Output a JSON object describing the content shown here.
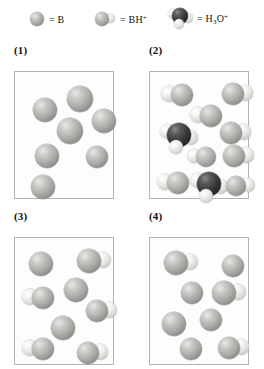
{
  "legend": {
    "entries": [
      {
        "name": "boron-base",
        "icon": "single-grey-sphere",
        "equals": "=",
        "label": "B"
      },
      {
        "name": "bh-cation",
        "icon": "grey-sphere-with-hydrogen",
        "equals": "=",
        "label_main": "BH",
        "label_sup": "+"
      },
      {
        "name": "hydronium",
        "icon": "dark-sphere-with-three-hydrogens",
        "equals": "=",
        "label_main": "H",
        "label_sub": "3",
        "label_main2": "O",
        "label_sup": "+"
      }
    ]
  },
  "panels": [
    {
      "id": "panel-1",
      "title": "(1)",
      "species_counts": {
        "B": 7,
        "BH+": 0,
        "H3O+": 0
      },
      "molecules": [
        {
          "type": "B",
          "x": 52,
          "y": 14,
          "r": 13
        },
        {
          "type": "B",
          "x": 18,
          "y": 26,
          "r": 12
        },
        {
          "type": "B",
          "x": 77,
          "y": 37,
          "r": 12
        },
        {
          "type": "B",
          "x": 42,
          "y": 46,
          "r": 13
        },
        {
          "type": "B",
          "x": 20,
          "y": 72,
          "r": 12
        },
        {
          "type": "B",
          "x": 71,
          "y": 74,
          "r": 11
        },
        {
          "type": "B",
          "x": 16,
          "y": 103,
          "r": 12
        }
      ]
    },
    {
      "id": "panel-2",
      "title": "(2)",
      "species_counts": {
        "B": 0,
        "BH+": 8,
        "H3O+": 2
      },
      "molecules": [
        {
          "type": "BH+",
          "x": 12,
          "y": 12,
          "r": 11,
          "flip": false
        },
        {
          "type": "BH+",
          "x": 72,
          "y": 11,
          "r": 11,
          "flip": true
        },
        {
          "type": "BH+",
          "x": 41,
          "y": 33,
          "r": 11,
          "flip": false
        },
        {
          "type": "H3O+",
          "x": 10,
          "y": 52,
          "r": 12
        },
        {
          "type": "BH+",
          "x": 70,
          "y": 50,
          "r": 11,
          "flip": true
        },
        {
          "type": "BH+",
          "x": 38,
          "y": 75,
          "r": 10,
          "flip": false
        },
        {
          "type": "BH+",
          "x": 73,
          "y": 73,
          "r": 11,
          "flip": true
        },
        {
          "type": "BH+",
          "x": 8,
          "y": 100,
          "r": 11,
          "flip": false
        },
        {
          "type": "H3O+",
          "x": 40,
          "y": 101,
          "r": 12
        },
        {
          "type": "BH+",
          "x": 76,
          "y": 104,
          "r": 10,
          "flip": true
        }
      ]
    },
    {
      "id": "panel-3",
      "title": "(3)",
      "species_counts": {
        "B": 3,
        "BH+": 5,
        "H3O+": 0
      },
      "molecules": [
        {
          "type": "B",
          "x": 14,
          "y": 14,
          "r": 12
        },
        {
          "type": "BH+",
          "x": 62,
          "y": 11,
          "r": 12,
          "flip": true
        },
        {
          "type": "B",
          "x": 49,
          "y": 40,
          "r": 12
        },
        {
          "type": "BH+",
          "x": 8,
          "y": 49,
          "r": 11,
          "flip": false
        },
        {
          "type": "BH+",
          "x": 71,
          "y": 62,
          "r": 11,
          "flip": true
        },
        {
          "type": "B",
          "x": 36,
          "y": 78,
          "r": 12
        },
        {
          "type": "BH+",
          "x": 8,
          "y": 100,
          "r": 11,
          "flip": false
        },
        {
          "type": "BH+",
          "x": 62,
          "y": 104,
          "r": 11,
          "flip": true
        }
      ]
    },
    {
      "id": "panel-4",
      "title": "(4)",
      "species_counts": {
        "B": 5,
        "BH+": 3,
        "H3O+": 0
      },
      "molecules": [
        {
          "type": "BH+",
          "x": 14,
          "y": 13,
          "r": 12,
          "flip": true
        },
        {
          "type": "B",
          "x": 72,
          "y": 17,
          "r": 11
        },
        {
          "type": "B",
          "x": 31,
          "y": 44,
          "r": 11
        },
        {
          "type": "BH+",
          "x": 62,
          "y": 43,
          "r": 12,
          "flip": true
        },
        {
          "type": "B",
          "x": 12,
          "y": 74,
          "r": 12
        },
        {
          "type": "B",
          "x": 50,
          "y": 71,
          "r": 11
        },
        {
          "type": "B",
          "x": 30,
          "y": 100,
          "r": 11
        },
        {
          "type": "BH+",
          "x": 68,
          "y": 99,
          "r": 11,
          "flip": true
        }
      ]
    }
  ],
  "layout": {
    "panel_box": {
      "w": 100,
      "h": 128
    },
    "positions": [
      {
        "box_x": 14,
        "box_y": 71,
        "title_x": 14,
        "title_y": 44
      },
      {
        "box_x": 149,
        "box_y": 71,
        "title_x": 149,
        "title_y": 44
      },
      {
        "box_x": 14,
        "box_y": 237,
        "title_x": 14,
        "title_y": 210
      },
      {
        "box_x": 149,
        "box_y": 237,
        "title_x": 149,
        "title_y": 210
      }
    ],
    "legend_entry_x": [
      30,
      95,
      168
    ]
  }
}
